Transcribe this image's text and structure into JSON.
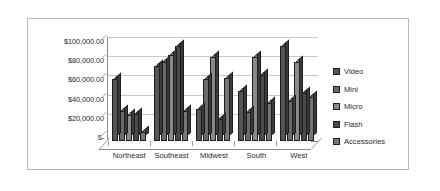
{
  "chart_data": {
    "type": "bar",
    "title": "",
    "xlabel": "",
    "ylabel": "",
    "grid": true,
    "legend_position": "right",
    "ylim": [
      0,
      100000
    ],
    "ytick_labels": [
      "$100,000.00",
      "$80,000.00",
      "$60,000.00",
      "$40,000.00",
      "$20,000.00",
      "$-"
    ],
    "ytick_values": [
      100000,
      80000,
      60000,
      40000,
      20000,
      0
    ],
    "categories": [
      "Northeast",
      "Southeast",
      "Midwest",
      "South",
      "West"
    ],
    "series": [
      {
        "name": "Video",
        "color": "#555555",
        "values": [
          65000,
          78000,
          33000,
          52000,
          99000
        ]
      },
      {
        "name": "Mini",
        "color": "#6b6b6b",
        "values": [
          31000,
          82000,
          65000,
          30000,
          42000
        ]
      },
      {
        "name": "Micro",
        "color": "#8a8a8a",
        "values": [
          27000,
          90000,
          87000,
          87000,
          82000
        ]
      },
      {
        "name": "Flash",
        "color": "#4a4a4a",
        "values": [
          28000,
          99000,
          23000,
          69000,
          50000
        ]
      },
      {
        "name": "Accessories",
        "color": "#777777",
        "values": [
          9000,
          31000,
          66000,
          40000,
          46000
        ]
      }
    ]
  },
  "legend": {
    "items": [
      {
        "label": "Video"
      },
      {
        "label": "Mini"
      },
      {
        "label": "Micro"
      },
      {
        "label": "Flash"
      },
      {
        "label": "Accessories"
      }
    ]
  }
}
